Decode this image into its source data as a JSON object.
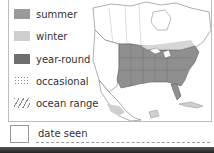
{
  "legend": {
    "items": [
      {
        "label": "summer",
        "color": "#9a9a9a",
        "style": "solid"
      },
      {
        "label": "winter",
        "color": "#cfcfcf",
        "style": "solid"
      },
      {
        "label": "year-round",
        "color": "#6f6f6f",
        "style": "solid"
      },
      {
        "label": "occasional",
        "color": "#888888",
        "style": "dotted"
      },
      {
        "label": "ocean range",
        "color": "#888888",
        "style": "hatched"
      }
    ]
  },
  "map": {
    "region": "North America",
    "summer_range_color": "#8f8f8f",
    "winter_range_color": "#cfcfcf"
  },
  "date_seen": {
    "label": "date seen",
    "value": ""
  }
}
